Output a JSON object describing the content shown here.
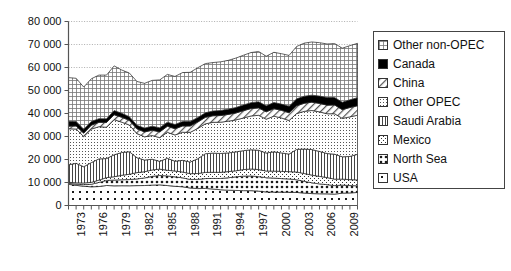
{
  "chart_data": {
    "type": "area",
    "stacked": true,
    "title": "",
    "subtitle": "",
    "xlabel": "",
    "ylabel": "",
    "grid": true,
    "legend_position": "right",
    "xlim": [
      1973,
      2011
    ],
    "ylim": [
      0,
      80000
    ],
    "yticks": [
      0,
      10000,
      20000,
      30000,
      40000,
      50000,
      60000,
      70000,
      80000
    ],
    "ytick_labels": [
      "0",
      "10 000",
      "20 000",
      "30 000",
      "40 000",
      "50 000",
      "60 000",
      "70 000",
      "80 000"
    ],
    "x": [
      1973,
      1974,
      1975,
      1976,
      1977,
      1978,
      1979,
      1980,
      1981,
      1982,
      1983,
      1984,
      1985,
      1986,
      1987,
      1988,
      1989,
      1990,
      1991,
      1992,
      1993,
      1994,
      1995,
      1996,
      1997,
      1998,
      1999,
      2000,
      2001,
      2002,
      2003,
      2004,
      2005,
      2006,
      2007,
      2008,
      2009,
      2010,
      2011
    ],
    "xticks": [
      1973,
      1974,
      1975,
      1976,
      1977,
      1978,
      1979,
      1980,
      1981,
      1982,
      1983,
      1984,
      1985,
      1986,
      1987,
      1988,
      1989,
      1990,
      1991,
      1992,
      1993,
      1994,
      1995,
      1996,
      1997,
      1998,
      1999,
      2000,
      2001,
      2002,
      2003,
      2004,
      2005,
      2006,
      2007,
      2008,
      2009,
      2010,
      2011
    ],
    "xtick_labels": [
      "1973",
      "",
      "",
      "1976",
      "",
      "",
      "1979",
      "",
      "",
      "1982",
      "",
      "",
      "1985",
      "",
      "",
      "1988",
      "",
      "",
      "1991",
      "",
      "",
      "1994",
      "",
      "",
      "1997",
      "",
      "",
      "2000",
      "",
      "",
      "2003",
      "",
      "",
      "2006",
      "",
      "",
      "2009",
      "",
      ""
    ],
    "series": [
      {
        "name": "USA",
        "pattern": "sparse-dots",
        "values": [
          9208,
          8774,
          8375,
          8132,
          8245,
          8707,
          8552,
          8597,
          8572,
          8649,
          8688,
          8879,
          8971,
          8680,
          8349,
          8140,
          7613,
          7355,
          7417,
          7171,
          6847,
          6662,
          6560,
          6465,
          6452,
          6252,
          5881,
          5822,
          5801,
          5746,
          5681,
          5419,
          5178,
          5102,
          5064,
          4950,
          5361,
          5475,
          5659
        ]
      },
      {
        "name": "North Sea",
        "pattern": "medium-dots",
        "values": [
          420,
          520,
          700,
          1100,
          1800,
          2200,
          2500,
          2600,
          2700,
          2900,
          3300,
          3800,
          4100,
          4200,
          4100,
          3900,
          3700,
          4000,
          4300,
          4600,
          4900,
          5400,
          5900,
          6300,
          6400,
          6300,
          6200,
          6100,
          5900,
          5800,
          5500,
          5100,
          4700,
          4300,
          4000,
          3700,
          3500,
          3200,
          2900
        ]
      },
      {
        "name": "Mexico",
        "pattern": "diag-dots",
        "values": [
          465,
          571,
          705,
          830,
          981,
          1209,
          1461,
          1936,
          2313,
          2748,
          2689,
          2780,
          2745,
          2435,
          2548,
          2512,
          2520,
          2553,
          2676,
          2668,
          2673,
          2685,
          2618,
          2858,
          3023,
          3070,
          2906,
          3012,
          3127,
          3177,
          3371,
          3383,
          3333,
          3256,
          3082,
          2792,
          2601,
          2577,
          2553
        ]
      },
      {
        "name": "Saudi Arabia",
        "pattern": "vertical-lines",
        "values": [
          7596,
          8480,
          7075,
          8577,
          9245,
          8301,
          9532,
          9900,
          9815,
          6483,
          5086,
          4663,
          3388,
          5208,
          4265,
          5086,
          5064,
          6410,
          8115,
          8332,
          8198,
          8120,
          8231,
          8218,
          8362,
          8389,
          7833,
          8404,
          8031,
          7634,
          9817,
          10638,
          11096,
          10853,
          10449,
          10846,
          9713,
          10075,
          11153
        ]
      },
      {
        "name": "Other OPEC",
        "pattern": "fine-dots",
        "values": [
          15700,
          14900,
          13100,
          14600,
          14000,
          13600,
          15300,
          13200,
          11600,
          10500,
          10100,
          10300,
          10300,
          11300,
          11400,
          12200,
          12900,
          13200,
          13000,
          13400,
          13600,
          13800,
          13900,
          14200,
          14700,
          15200,
          14700,
          15500,
          15200,
          14600,
          15600,
          16400,
          17000,
          17200,
          17300,
          17600,
          16700,
          17200,
          17000
        ]
      },
      {
        "name": "China",
        "pattern": "diag-hatch",
        "values": [
          1090,
          1315,
          1490,
          1670,
          1874,
          2082,
          2122,
          2114,
          2012,
          2045,
          2120,
          2296,
          2505,
          2620,
          2690,
          2730,
          2760,
          2774,
          2828,
          2845,
          2890,
          2930,
          2990,
          3170,
          3200,
          3200,
          3210,
          3250,
          3300,
          3350,
          3400,
          3490,
          3620,
          3680,
          3730,
          3800,
          3800,
          4070,
          4090
        ]
      },
      {
        "name": "Canada",
        "pattern": "solid-black",
        "values": [
          2115,
          1995,
          1735,
          1595,
          1610,
          1595,
          1805,
          1764,
          1610,
          1560,
          1665,
          1775,
          1810,
          1805,
          1880,
          1975,
          1955,
          1965,
          1980,
          2065,
          2190,
          2305,
          2400,
          2480,
          2590,
          2680,
          2600,
          2700,
          2720,
          2850,
          2990,
          3090,
          3040,
          3190,
          3310,
          3260,
          3230,
          3340,
          3520
        ]
      },
      {
        "name": "Other non-OPEC",
        "pattern": "cross-hatch",
        "values": [
          19006,
          18745,
          18320,
          18596,
          18940,
          19006,
          19428,
          18789,
          18978,
          19035,
          19462,
          19907,
          20781,
          20752,
          20868,
          21257,
          21388,
          21643,
          21384,
          21069,
          21162,
          21198,
          21482,
          21629,
          21773,
          21859,
          21570,
          21812,
          21921,
          22093,
          22791,
          23080,
          23133,
          23219,
          23295,
          23452,
          23495,
          23563,
          23625
        ]
      }
    ],
    "totals": [
      55600,
      55300,
      51500,
      55100,
      56695,
      56700,
      60700,
      52900,
      51600,
      53920,
      53110,
      54400,
      54600,
      57000,
      54100,
      55800,
      57900,
      59900,
      59700,
      60150,
      61460,
      61100,
      62080,
      65320,
      66500,
      66950,
      64900,
      66600,
      66000,
      65250,
      69150,
      70600,
      71100,
      70800,
      70230,
      70400,
      68400,
      69500,
      70500
    ]
  },
  "legend": {
    "items": [
      {
        "label": "Other non-OPEC",
        "swatch": "cross-hatch"
      },
      {
        "label": "Canada",
        "swatch": "solid-black"
      },
      {
        "label": "China",
        "swatch": "diag-hatch"
      },
      {
        "label": "Other OPEC",
        "swatch": "fine-dots"
      },
      {
        "label": "Saudi Arabia",
        "swatch": "vertical-lines"
      },
      {
        "label": "Mexico",
        "swatch": "diag-dots"
      },
      {
        "label": "North Sea",
        "swatch": "medium-dots"
      },
      {
        "label": "USA",
        "swatch": "sparse-dots"
      }
    ]
  },
  "colors": {
    "axis": "#555555",
    "grid": "#999999",
    "text": "#111111",
    "black_band": "#000000",
    "plot_background": "#ffffff"
  }
}
